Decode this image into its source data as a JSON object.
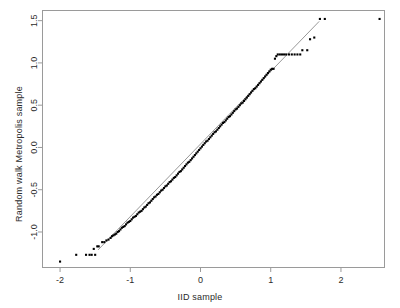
{
  "chart_data": {
    "type": "scatter",
    "title": "",
    "subtitle": "",
    "xlabel": "IID sample",
    "ylabel": "Random walk Metropolis sample",
    "xlim": [
      -2.25,
      2.62
    ],
    "ylim": [
      -1.42,
      1.62
    ],
    "xticks": [
      -2,
      -1,
      0,
      1,
      2
    ],
    "xticklabels": [
      "-2",
      "-1",
      "0",
      "1",
      "2"
    ],
    "yticks": [
      -1.0,
      -0.5,
      0.0,
      0.5,
      1.0,
      1.5
    ],
    "yticklabels": [
      "-1.0",
      "-0.5",
      "0.0",
      "0.5",
      "1.0",
      "1.5"
    ],
    "grid": false,
    "legend": null,
    "point_color": "#000000",
    "point_shape": "square",
    "point_size_px": 2.1,
    "frame_color": "#9a9a9a",
    "line_color": "#8c8c8c",
    "reference_line": {
      "name": "qqline",
      "slope": 0.8585,
      "intercept": 0.0405,
      "x_start": -1.46,
      "x_end": 1.69
    },
    "series": [
      {
        "name": "qq-points",
        "x": [
          -2.0,
          -1.77,
          -1.63,
          -1.58,
          -1.55,
          -1.52,
          -1.5,
          -1.47,
          -1.45,
          -1.4,
          -1.37,
          -1.34,
          -1.31,
          -1.28,
          -1.26,
          -1.24,
          -1.22,
          -1.2,
          -1.18,
          -1.16,
          -1.14,
          -1.12,
          -1.1,
          -1.08,
          -1.06,
          -1.04,
          -1.02,
          -1.0,
          -0.98,
          -0.96,
          -0.94,
          -0.92,
          -0.9,
          -0.88,
          -0.86,
          -0.84,
          -0.82,
          -0.8,
          -0.78,
          -0.76,
          -0.74,
          -0.72,
          -0.7,
          -0.68,
          -0.66,
          -0.64,
          -0.62,
          -0.6,
          -0.58,
          -0.56,
          -0.54,
          -0.52,
          -0.5,
          -0.48,
          -0.46,
          -0.44,
          -0.42,
          -0.4,
          -0.38,
          -0.36,
          -0.34,
          -0.32,
          -0.3,
          -0.28,
          -0.26,
          -0.24,
          -0.22,
          -0.2,
          -0.18,
          -0.16,
          -0.14,
          -0.12,
          -0.1,
          -0.08,
          -0.06,
          -0.04,
          -0.02,
          0.0,
          0.02,
          0.04,
          0.06,
          0.08,
          0.1,
          0.12,
          0.14,
          0.16,
          0.18,
          0.2,
          0.22,
          0.24,
          0.26,
          0.28,
          0.3,
          0.32,
          0.34,
          0.36,
          0.38,
          0.4,
          0.42,
          0.44,
          0.46,
          0.48,
          0.5,
          0.52,
          0.54,
          0.56,
          0.58,
          0.6,
          0.62,
          0.64,
          0.66,
          0.68,
          0.7,
          0.72,
          0.74,
          0.76,
          0.78,
          0.8,
          0.82,
          0.84,
          0.86,
          0.88,
          0.9,
          0.92,
          0.94,
          0.96,
          0.98,
          1.0,
          1.02,
          1.04,
          1.06,
          1.08,
          1.1,
          1.13,
          1.16,
          1.19,
          1.22,
          1.26,
          1.3,
          1.34,
          1.38,
          1.42,
          1.45,
          1.52,
          1.56,
          1.62,
          1.7,
          1.77,
          2.55
        ],
        "y": [
          -1.35,
          -1.27,
          -1.27,
          -1.27,
          -1.27,
          -1.2,
          -1.27,
          -1.17,
          -1.17,
          -1.12,
          -1.12,
          -1.1,
          -1.09,
          -1.07,
          -1.05,
          -1.04,
          -1.03,
          -1.02,
          -1.0,
          -0.99,
          -0.97,
          -0.95,
          -0.94,
          -0.93,
          -0.91,
          -0.89,
          -0.88,
          -0.87,
          -0.85,
          -0.83,
          -0.82,
          -0.81,
          -0.79,
          -0.77,
          -0.76,
          -0.75,
          -0.73,
          -0.71,
          -0.7,
          -0.68,
          -0.66,
          -0.65,
          -0.63,
          -0.61,
          -0.59,
          -0.58,
          -0.56,
          -0.55,
          -0.53,
          -0.51,
          -0.5,
          -0.48,
          -0.46,
          -0.45,
          -0.43,
          -0.41,
          -0.4,
          -0.38,
          -0.36,
          -0.35,
          -0.33,
          -0.31,
          -0.29,
          -0.28,
          -0.26,
          -0.24,
          -0.22,
          -0.2,
          -0.18,
          -0.17,
          -0.15,
          -0.13,
          -0.11,
          -0.09,
          -0.07,
          -0.05,
          -0.03,
          -0.01,
          0.01,
          0.03,
          0.05,
          0.07,
          0.08,
          0.1,
          0.12,
          0.14,
          0.16,
          0.18,
          0.19,
          0.21,
          0.23,
          0.25,
          0.27,
          0.29,
          0.3,
          0.32,
          0.34,
          0.36,
          0.37,
          0.39,
          0.41,
          0.43,
          0.45,
          0.46,
          0.48,
          0.5,
          0.52,
          0.53,
          0.55,
          0.57,
          0.59,
          0.61,
          0.63,
          0.65,
          0.67,
          0.69,
          0.7,
          0.72,
          0.74,
          0.76,
          0.78,
          0.8,
          0.82,
          0.84,
          0.86,
          0.88,
          0.9,
          0.92,
          0.93,
          0.93,
          1.05,
          1.08,
          1.1,
          1.1,
          1.1,
          1.1,
          1.1,
          1.1,
          1.1,
          1.1,
          1.1,
          1.1,
          1.15,
          1.15,
          1.28,
          1.3,
          1.52,
          1.52,
          1.52
        ]
      }
    ]
  }
}
